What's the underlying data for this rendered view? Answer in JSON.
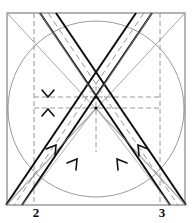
{
  "figure": {
    "canvas": {
      "width": 192,
      "height": 223
    },
    "colors": {
      "ink": "#111111",
      "band_outline": "#0a0a0a",
      "thin_line": "#8f8f8f",
      "dashed_line": "#8a8a8a",
      "circle": "#949494",
      "background": "#ffffff"
    },
    "frame": {
      "name": "square-frame",
      "left": 7,
      "top": 13,
      "right": 185,
      "bottom": 205,
      "stroke_width": 1
    },
    "circle": {
      "name": "inscribed-circle",
      "cx": 96,
      "cy": 109,
      "r": 88,
      "stroke_width": 1
    },
    "diagonals": [
      {
        "name": "diagonal-tl-br",
        "x1": 7,
        "y1": 13,
        "x2": 185,
        "y2": 205
      },
      {
        "name": "diagonal-tr-bl",
        "x1": 185,
        "y1": 13,
        "x2": 7,
        "y2": 205
      }
    ],
    "dashed_verticals": [
      {
        "name": "vertical-guide-left",
        "x": 34,
        "y1": 13,
        "y2": 205
      },
      {
        "name": "vertical-guide-right",
        "x": 160,
        "y1": 13,
        "y2": 205
      },
      {
        "name": "vertical-axis-center",
        "x": 96,
        "y1": 88,
        "y2": 150
      }
    ],
    "dashed_horizontals": [
      {
        "name": "horizontal-guide-upper",
        "x1": 34,
        "y1": 97,
        "x2": 160,
        "y2": 97
      },
      {
        "name": "horizontal-guide-lower",
        "x1": 34,
        "y1": 108,
        "x2": 160,
        "y2": 108
      }
    ],
    "bands": [
      {
        "name": "band-left-to-right",
        "note": "band descending from upper-left toward lower-right",
        "edge_a": {
          "x1": 40,
          "y1": 13,
          "x2": 170,
          "y2": 205
        },
        "edge_b": {
          "x1": 56,
          "y1": 13,
          "x2": 186,
          "y2": 205
        },
        "centerline": {
          "x1": 48,
          "y1": 13,
          "x2": 178,
          "y2": 205
        },
        "stroke_width": 2
      },
      {
        "name": "band-right-to-left",
        "note": "band descending from upper-right toward lower-left",
        "edge_a": {
          "x1": 152,
          "y1": 13,
          "x2": 22,
          "y2": 205
        },
        "edge_b": {
          "x1": 136,
          "y1": 13,
          "x2": 6,
          "y2": 205
        },
        "centerline": {
          "x1": 144,
          "y1": 13,
          "x2": 14,
          "y2": 205
        },
        "stroke_width": 2
      }
    ],
    "crossing_nodes": [
      {
        "name": "node-upper",
        "x": 96,
        "y": 97
      },
      {
        "name": "node-lower",
        "x": 96,
        "y": 108
      }
    ],
    "arrow_markers": [
      {
        "name": "arrow-center-down",
        "x": 48,
        "y": 95,
        "direction": "down"
      },
      {
        "name": "arrow-center-up",
        "x": 48,
        "y": 111,
        "direction": "up"
      },
      {
        "name": "arrow-lower-left-outer",
        "x": 53,
        "y": 149,
        "direction": "up-right"
      },
      {
        "name": "arrow-lower-left-inner",
        "x": 74,
        "y": 163,
        "direction": "up-right"
      },
      {
        "name": "arrow-lower-right-inner",
        "x": 120,
        "y": 163,
        "direction": "up-left"
      },
      {
        "name": "arrow-lower-right-outer",
        "x": 142,
        "y": 149,
        "direction": "up-left"
      }
    ],
    "labels": [
      {
        "name": "label-point-2",
        "text": "2",
        "x": 34,
        "y": 212
      },
      {
        "name": "label-point-3",
        "text": "3",
        "x": 160,
        "y": 212
      }
    ]
  }
}
